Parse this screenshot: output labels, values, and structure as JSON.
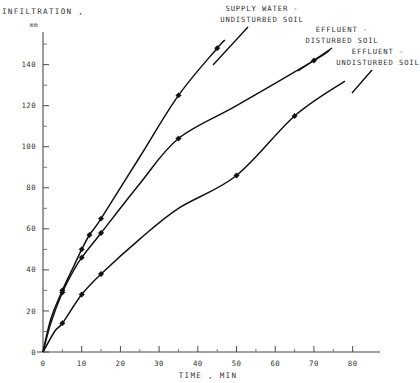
{
  "chart_data": {
    "type": "line",
    "title": "",
    "subtitle": "",
    "xlabel": "TIME , MIN",
    "ylabel": "INFILTRATION ,",
    "yunit": "mm",
    "xlim": [
      0,
      85
    ],
    "ylim": [
      0,
      152
    ],
    "xticks": [
      0,
      10,
      20,
      30,
      40,
      50,
      60,
      70,
      80
    ],
    "yticks": [
      0,
      20,
      40,
      60,
      80,
      100,
      120,
      140
    ],
    "xminor_step": 5,
    "yminor_step": 10,
    "grid": false,
    "legend_position": "annotations-above-curves",
    "marker": "filled-diamond",
    "series": [
      {
        "name": "SUPPLY WATER - UNDISTURBED SOIL",
        "label_line1": "SUPPLY WATER -",
        "label_line2": "UNDISTURBED SOIL",
        "color": "#111111",
        "points": [
          {
            "x": 0,
            "y": 0
          },
          {
            "x": 2,
            "y": 16
          },
          {
            "x": 5,
            "y": 30
          },
          {
            "x": 8,
            "y": 42
          },
          {
            "x": 10,
            "y": 50
          },
          {
            "x": 12,
            "y": 57
          },
          {
            "x": 15,
            "y": 65
          },
          {
            "x": 25,
            "y": 95
          },
          {
            "x": 35,
            "y": 125
          },
          {
            "x": 45,
            "y": 148
          },
          {
            "x": 47,
            "y": 152
          }
        ],
        "markers": [
          {
            "x": 5,
            "y": 30
          },
          {
            "x": 10,
            "y": 50
          },
          {
            "x": 12,
            "y": 57
          },
          {
            "x": 15,
            "y": 65
          },
          {
            "x": 35,
            "y": 125
          },
          {
            "x": 45,
            "y": 148
          }
        ]
      },
      {
        "name": "EFFLUENT - DISTURBED SOIL",
        "label_line1": "EFFLUENT -",
        "label_line2": "DISTURBED SOIL",
        "color": "#111111",
        "points": [
          {
            "x": 0,
            "y": 0
          },
          {
            "x": 2,
            "y": 14
          },
          {
            "x": 5,
            "y": 29
          },
          {
            "x": 8,
            "y": 40
          },
          {
            "x": 10,
            "y": 46
          },
          {
            "x": 15,
            "y": 58
          },
          {
            "x": 25,
            "y": 82
          },
          {
            "x": 35,
            "y": 104
          },
          {
            "x": 50,
            "y": 120
          },
          {
            "x": 70,
            "y": 142
          },
          {
            "x": 74,
            "y": 147
          }
        ],
        "markers": [
          {
            "x": 5,
            "y": 29
          },
          {
            "x": 10,
            "y": 46
          },
          {
            "x": 15,
            "y": 58
          },
          {
            "x": 35,
            "y": 104
          },
          {
            "x": 70,
            "y": 142
          }
        ]
      },
      {
        "name": "EFFLUENT - UNDISTURBED SOIL",
        "label_line1": "EFFLUENT -",
        "label_line2": "UNDISTURBED SOIL",
        "color": "#111111",
        "points": [
          {
            "x": 0,
            "y": 0
          },
          {
            "x": 3,
            "y": 10
          },
          {
            "x": 5,
            "y": 14
          },
          {
            "x": 10,
            "y": 28
          },
          {
            "x": 15,
            "y": 38
          },
          {
            "x": 25,
            "y": 55
          },
          {
            "x": 35,
            "y": 70
          },
          {
            "x": 50,
            "y": 86
          },
          {
            "x": 65,
            "y": 115
          },
          {
            "x": 78,
            "y": 132
          }
        ],
        "markers": [
          {
            "x": 5,
            "y": 14
          },
          {
            "x": 10,
            "y": 28
          },
          {
            "x": 15,
            "y": 38
          },
          {
            "x": 50,
            "y": 86
          },
          {
            "x": 65,
            "y": 115
          }
        ]
      }
    ]
  }
}
